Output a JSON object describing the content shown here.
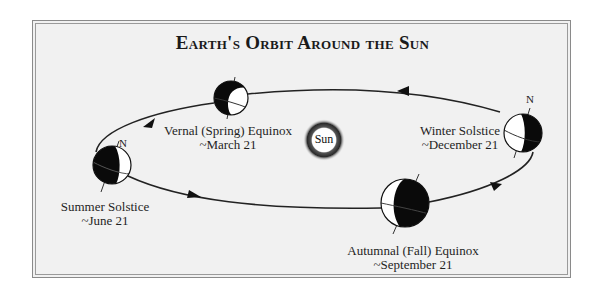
{
  "title": "Earth's Orbit Around the Sun",
  "sun": {
    "label": "Sun"
  },
  "north_label": "N",
  "positions": [
    {
      "id": "vernal",
      "name": "Vernal (Spring) Equinox",
      "date": "~March 21"
    },
    {
      "id": "winter",
      "name": "Winter Solstice",
      "date": "~December 21"
    },
    {
      "id": "summer",
      "name": "Summer Solstice",
      "date": "~June 21"
    },
    {
      "id": "autumnal",
      "name": "Autumnal (Fall) Equinox",
      "date": "~September 21"
    }
  ],
  "colors": {
    "background": "#f1f1f1",
    "frame_border": "#8a8a8a",
    "orbit_line": "#222222",
    "night_side": "#0a0a0a",
    "day_side": "#ffffff"
  }
}
